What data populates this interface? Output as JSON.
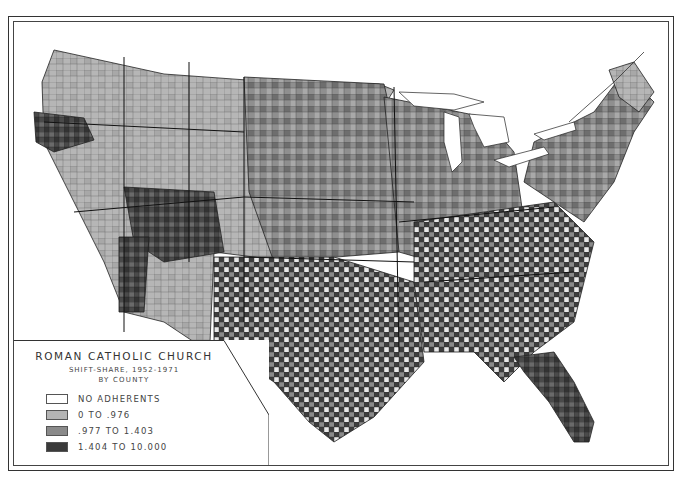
{
  "legend": {
    "title": "ROMAN CATHOLIC CHURCH",
    "subtitle": "SHIFT-SHARE, 1952-1971",
    "subtitle2": "BY COUNTY",
    "items": [
      {
        "label": "NO ADHERENTS",
        "color": "#ffffff"
      },
      {
        "label": "0 TO .976",
        "color": "#b4b4b4"
      },
      {
        "label": ".977 TO 1.403",
        "color": "#8a8a8a"
      },
      {
        "label": "1.404 TO 10.000",
        "color": "#3a3a3a"
      }
    ]
  },
  "map": {
    "subject": "United States counties choropleth",
    "classes": [
      "no-adherents",
      "low",
      "medium",
      "high"
    ]
  }
}
